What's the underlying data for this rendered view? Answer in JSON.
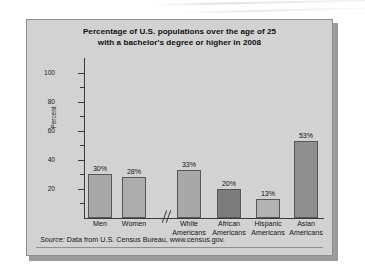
{
  "figure": {
    "title_line1": "Percentage of U.S. populations over the age of 25",
    "title_line2": "with a bachelor's degree or higher in 2008",
    "source_label": "Source:",
    "source_text": " Data from U.S. Census Bureau, www.census.gov."
  },
  "chart_data": {
    "type": "bar",
    "title": "Percentage of U.S. populations over the age of 25 with a bachelor's degree or higher in 2008",
    "xlabel": "",
    "ylabel": "Percent",
    "ylim": [
      0,
      110
    ],
    "yticks": [
      20,
      40,
      60,
      80,
      100
    ],
    "ytick_labels": [
      "20",
      "40",
      "60",
      "80",
      "100"
    ],
    "minor_yticks": [
      10,
      30,
      50,
      70,
      90
    ],
    "grid": false,
    "legend": "none",
    "axis_break_after_index": 1,
    "categories": [
      "Men",
      "Women",
      "White Americans",
      "African Americans",
      "Hispanic Americans",
      "Asian Americans"
    ],
    "category_lines": [
      [
        "Men"
      ],
      [
        "Women"
      ],
      [
        "White",
        "Americans"
      ],
      [
        "African",
        "Americans"
      ],
      [
        "Hispanic",
        "Americans"
      ],
      [
        "Asian",
        "Americans"
      ]
    ],
    "values": [
      30,
      28,
      33,
      20,
      13,
      53
    ],
    "data_labels": [
      "30%",
      "28%",
      "33%",
      "20%",
      "13%",
      "53%"
    ],
    "bar_colors": [
      "#a8a8a8",
      "#adadad",
      "#a8a8a8",
      "#7c7c7c",
      "#b2b2b2",
      "#8f8f8f"
    ]
  },
  "colors": {
    "panel_background": "#d2d2d2",
    "page_background": "#ffffff",
    "axis": "#3a3a3a",
    "text": "#141414",
    "bar_outline": "#55575a"
  }
}
